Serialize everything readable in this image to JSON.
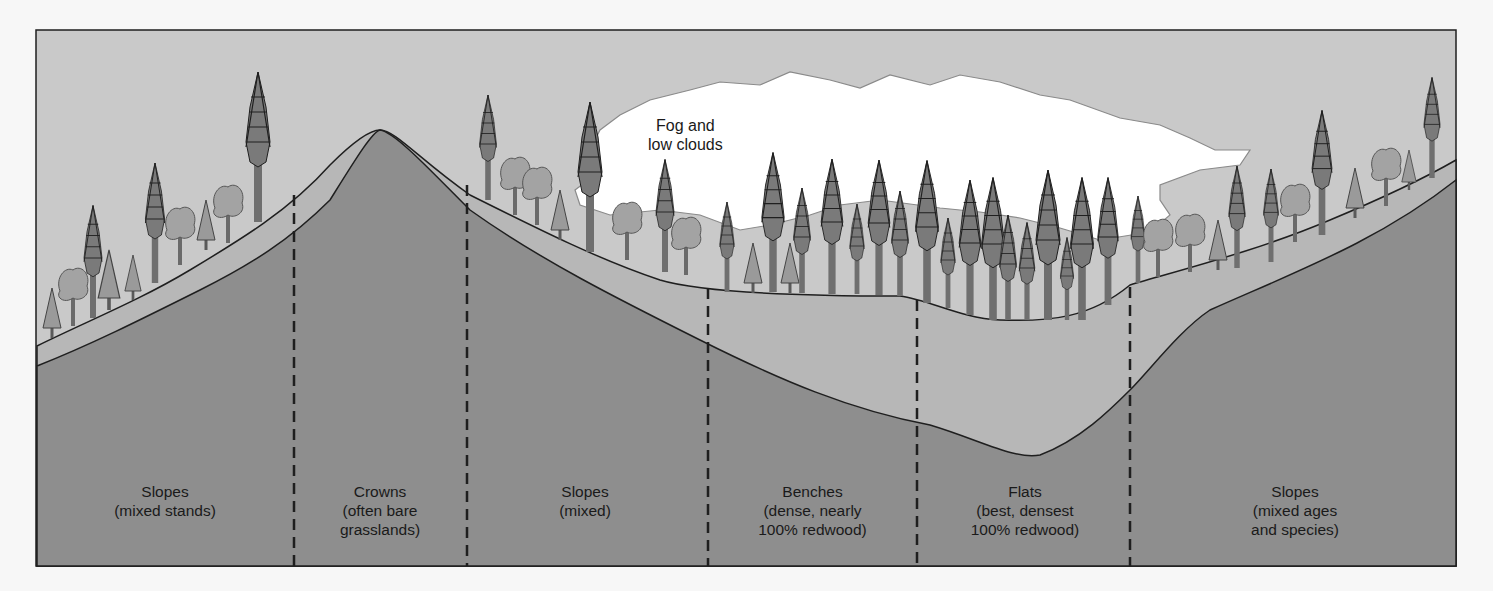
{
  "figure": {
    "fog_label": [
      "Fog and",
      "low clouds"
    ],
    "colors": {
      "sky": "#c9c9c9",
      "soil_light": "#b7b7b7",
      "bedrock_dark": "#8e8e8e",
      "fog": "#ffffff",
      "tree_trunk": "#6f6f6f",
      "tree_foliage": "#7a7a7a",
      "broadleaf": "#a3a3a3",
      "outline": "#1f1f1f"
    },
    "zones": [
      {
        "title": "Slopes",
        "desc": [
          "(mixed stands)"
        ]
      },
      {
        "title": "Crowns",
        "desc": [
          "(often bare",
          "grasslands)"
        ]
      },
      {
        "title": "Slopes",
        "desc": [
          "(mixed)"
        ]
      },
      {
        "title": "Benches",
        "desc": [
          "(dense, nearly",
          "100% redwood)"
        ]
      },
      {
        "title": "Flats",
        "desc": [
          "(best, densest",
          "100% redwood)"
        ]
      },
      {
        "title": "Slopes",
        "desc": [
          "(mixed ages",
          "and species)"
        ]
      }
    ]
  }
}
